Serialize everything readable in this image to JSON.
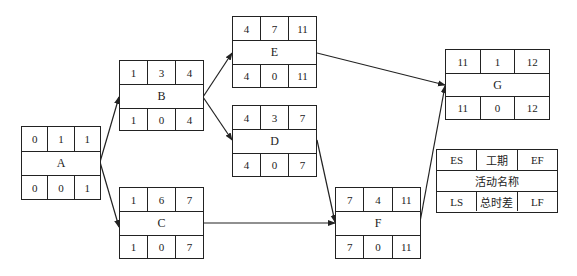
{
  "diagram": {
    "type": "activity-on-node network",
    "nodes": [
      {
        "id": "A",
        "name": "A",
        "ES": "0",
        "duration": "1",
        "EF": "1",
        "LS": "0",
        "TF": "0",
        "LF": "1"
      },
      {
        "id": "B",
        "name": "B",
        "ES": "1",
        "duration": "3",
        "EF": "4",
        "LS": "1",
        "TF": "0",
        "LF": "4"
      },
      {
        "id": "C",
        "name": "C",
        "ES": "1",
        "duration": "6",
        "EF": "7",
        "LS": "1",
        "TF": "0",
        "LF": "7"
      },
      {
        "id": "D",
        "name": "D",
        "ES": "4",
        "duration": "3",
        "EF": "7",
        "LS": "4",
        "TF": "0",
        "LF": "7"
      },
      {
        "id": "E",
        "name": "E",
        "ES": "4",
        "duration": "7",
        "EF": "11",
        "LS": "4",
        "TF": "0",
        "LF": "11"
      },
      {
        "id": "F",
        "name": "F",
        "ES": "7",
        "duration": "4",
        "EF": "11",
        "LS": "7",
        "TF": "0",
        "LF": "11"
      },
      {
        "id": "G",
        "name": "G",
        "ES": "11",
        "duration": "1",
        "EF": "12",
        "LS": "11",
        "TF": "0",
        "LF": "12"
      }
    ],
    "edges": [
      {
        "from": "A",
        "to": "B"
      },
      {
        "from": "A",
        "to": "C"
      },
      {
        "from": "B",
        "to": "E"
      },
      {
        "from": "B",
        "to": "D"
      },
      {
        "from": "C",
        "to": "F"
      },
      {
        "from": "D",
        "to": "F"
      },
      {
        "from": "E",
        "to": "G"
      },
      {
        "from": "F",
        "to": "G"
      }
    ],
    "legend": {
      "es": "ES",
      "duration": "工期",
      "ef": "EF",
      "name": "活动名称",
      "ls": "LS",
      "total_float": "总时差",
      "lf": "LF"
    },
    "colors": {
      "line": "#222222",
      "background": "#ffffff"
    }
  }
}
